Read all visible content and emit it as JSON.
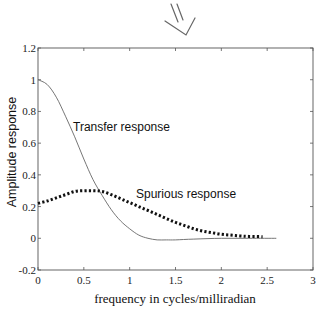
{
  "chart_data": {
    "type": "line",
    "title": "",
    "xlabel": "frequency in cycles/milliradian",
    "ylabel": "Amplitude response",
    "xlim": [
      0,
      3
    ],
    "ylim": [
      -0.2,
      1.2
    ],
    "xticks": [
      0,
      0.5,
      1,
      1.5,
      2,
      2.5,
      3
    ],
    "xtick_labels": [
      "0",
      "0.5",
      "1",
      "1.5",
      "2",
      "2.5",
      "3"
    ],
    "yticks": [
      -0.2,
      0,
      0.2,
      0.4,
      0.6,
      0.8,
      1,
      1.2
    ],
    "ytick_labels": [
      "-0.2",
      "0",
      "0.2",
      "0.4",
      "0.6",
      "0.8",
      "1",
      "1.2"
    ],
    "grid": false,
    "legend": "none (inline annotations)",
    "series": [
      {
        "name": "Transfer response",
        "style": "solid-thin",
        "x": [
          0,
          0.1,
          0.2,
          0.3,
          0.4,
          0.5,
          0.6,
          0.7,
          0.8,
          0.9,
          1.0,
          1.1,
          1.2,
          1.3,
          1.4,
          1.5,
          1.7,
          2.0,
          2.3,
          2.6
        ],
        "y": [
          1.0,
          0.97,
          0.89,
          0.77,
          0.64,
          0.5,
          0.37,
          0.27,
          0.18,
          0.11,
          0.06,
          0.02,
          0.0,
          -0.01,
          -0.01,
          -0.01,
          -0.005,
          0.0,
          0.0,
          0.0
        ]
      },
      {
        "name": "Spurious response",
        "style": "dotted-thick",
        "x": [
          0,
          0.1,
          0.2,
          0.3,
          0.4,
          0.5,
          0.6,
          0.7,
          0.8,
          0.9,
          1.0,
          1.1,
          1.2,
          1.3,
          1.4,
          1.5,
          1.6,
          1.7,
          1.8,
          1.9,
          2.0,
          2.1,
          2.2,
          2.3,
          2.45
        ],
        "y": [
          0.22,
          0.235,
          0.255,
          0.275,
          0.295,
          0.3,
          0.3,
          0.295,
          0.275,
          0.25,
          0.225,
          0.2,
          0.175,
          0.15,
          0.125,
          0.1,
          0.08,
          0.06,
          0.045,
          0.035,
          0.025,
          0.02,
          0.015,
          0.012,
          0.01
        ]
      }
    ],
    "annotations": [
      {
        "text": "Transfer response",
        "x": 0.38,
        "y": 0.76
      },
      {
        "text": "Spurious response",
        "x": 1.07,
        "y": 0.3
      }
    ]
  },
  "decoration": {
    "arrow_glyph": "hand-drawn-down-arrow"
  }
}
